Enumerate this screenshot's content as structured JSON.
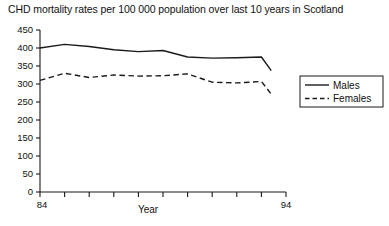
{
  "chart_data": {
    "type": "line",
    "title": "CHD mortality rates per 100 000 population over last 10 years in Scotland",
    "xlabel": "Year",
    "ylabel": "",
    "xlim": [
      84,
      94
    ],
    "ylim": [
      0,
      450
    ],
    "grid": false,
    "legend_position": "right",
    "x_tick_labels": [
      "84",
      "94"
    ],
    "y_tick_labels": [
      "0",
      "50",
      "100",
      "150",
      "200",
      "250",
      "300",
      "350",
      "400",
      "450"
    ],
    "y_ticks": [
      0,
      50,
      100,
      150,
      200,
      250,
      300,
      350,
      400,
      450
    ],
    "x": [
      84,
      85,
      86,
      87,
      88,
      89,
      90,
      91,
      92,
      93,
      93.4
    ],
    "series": [
      {
        "name": "Males",
        "style": "solid",
        "color": "#1a1a1a",
        "values": [
          400,
          410,
          404,
          395,
          390,
          393,
          375,
          372,
          373,
          375,
          337
        ]
      },
      {
        "name": "Females",
        "style": "dashed",
        "color": "#1a1a1a",
        "values": [
          310,
          330,
          318,
          325,
          322,
          323,
          328,
          305,
          303,
          307,
          272
        ]
      }
    ]
  },
  "legend": {
    "entries": [
      {
        "label": "Males",
        "style": "solid"
      },
      {
        "label": "Females",
        "style": "dashed"
      }
    ]
  }
}
